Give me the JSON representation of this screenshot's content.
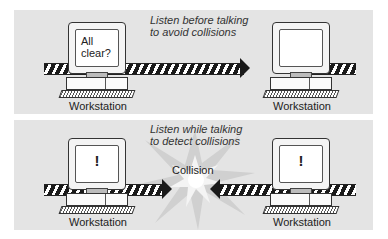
{
  "top_panel": {
    "caption_line1": "Listen before talking",
    "caption_line2": "to avoid collisions",
    "left_station": {
      "label": "Workstation",
      "screen_text": "All clear?"
    },
    "right_station": {
      "label": "Workstation",
      "screen_text": ""
    }
  },
  "bottom_panel": {
    "caption_line1": "Listen while talking",
    "caption_line2": "to detect collisions",
    "collision_label": "Collision",
    "left_station": {
      "label": "Workstation",
      "screen_text": "!"
    },
    "right_station": {
      "label": "Workstation",
      "screen_text": "!"
    }
  },
  "colors": {
    "panel_bg": "#e4e4e4",
    "cable_stripe": "#1a1a1a",
    "burst": "#cfcfcf"
  }
}
